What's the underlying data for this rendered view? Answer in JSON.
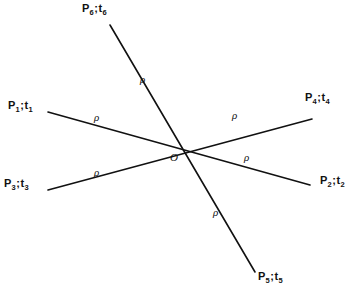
{
  "figure": {
    "type": "line-diagram",
    "width": 357,
    "height": 300,
    "background": "#ffffff",
    "stroke_color": "#111111",
    "origin": {
      "label": "O",
      "x": 178,
      "y": 145
    },
    "lines": [
      {
        "name": "line-p1-p2",
        "x1": 48,
        "y1": 112,
        "x2": 310,
        "y2": 185
      },
      {
        "name": "line-p3-p4",
        "x1": 48,
        "y1": 190,
        "x2": 312,
        "y2": 119
      },
      {
        "name": "line-p6-p5",
        "x1": 110,
        "y1": 25,
        "x2": 255,
        "y2": 272
      }
    ],
    "rays": [
      {
        "id": "p1",
        "point": "P",
        "point_sub": "1",
        "separator": ";",
        "time": "t",
        "time_sub": "1",
        "label_x": 8,
        "label_y": 100,
        "distance_symbol": "ρ",
        "rho_x": 94,
        "rho_y": 112
      },
      {
        "id": "p2",
        "point": "P",
        "point_sub": "2",
        "separator": ";",
        "time": "t",
        "time_sub": "2",
        "label_x": 320,
        "label_y": 175,
        "distance_symbol": "ρ",
        "rho_x": 244,
        "rho_y": 152
      },
      {
        "id": "p3",
        "point": "P",
        "point_sub": "3",
        "separator": ";",
        "time": "t",
        "time_sub": "3",
        "label_x": 4,
        "label_y": 178,
        "distance_symbol": "ρ",
        "rho_x": 94,
        "rho_y": 167
      },
      {
        "id": "p4",
        "point": "P",
        "point_sub": "4",
        "separator": ";",
        "time": "t",
        "time_sub": "4",
        "label_x": 305,
        "label_y": 92,
        "distance_symbol": "ρ",
        "rho_x": 232,
        "rho_y": 110
      },
      {
        "id": "p5",
        "point": "P",
        "point_sub": "5",
        "separator": ";",
        "time": "t",
        "time_sub": "5",
        "label_x": 258,
        "label_y": 271,
        "distance_symbol": "ρ",
        "rho_x": 213,
        "rho_y": 207
      },
      {
        "id": "p6",
        "point": "P",
        "point_sub": "6",
        "separator": ";",
        "time": "t",
        "time_sub": "6",
        "label_x": 82,
        "label_y": 3,
        "distance_symbol": "ρ",
        "rho_x": 140,
        "rho_y": 74
      }
    ]
  }
}
